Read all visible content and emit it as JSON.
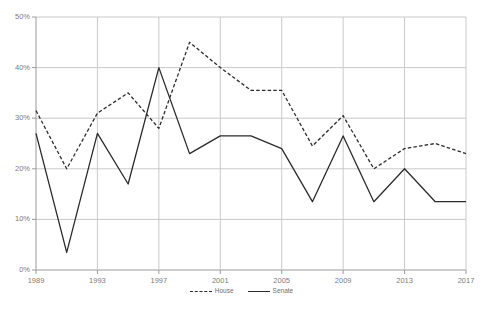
{
  "chart_data": {
    "type": "line",
    "title": "",
    "subtitle": "",
    "xlabel": "",
    "ylabel": "",
    "xlim": [
      1989,
      2017
    ],
    "ylim": [
      0,
      50
    ],
    "grid": true,
    "grid_axis": "both",
    "legend_position": "bottom-center",
    "x": [
      1989,
      1991,
      1993,
      1995,
      1997,
      1999,
      2001,
      2003,
      2005,
      2007,
      2009,
      2011,
      2013,
      2015,
      2017
    ],
    "categories": [
      "1989",
      "1991",
      "1993",
      "1995",
      "1997",
      "1999",
      "2001",
      "2003",
      "2005",
      "2007",
      "2009",
      "2011",
      "2013",
      "2015",
      "2017"
    ],
    "series": [
      {
        "name": "House",
        "style": "dashed",
        "color": "#2b2b2b",
        "values": [
          31.5,
          20.0,
          31.0,
          35.0,
          28.0,
          45.0,
          40.0,
          35.5,
          35.5,
          24.5,
          30.5,
          20.0,
          24.0,
          25.0,
          23.0
        ]
      },
      {
        "name": "Senate",
        "style": "solid",
        "color": "#2b2b2b",
        "values": [
          27.0,
          3.5,
          27.0,
          17.0,
          40.0,
          23.0,
          26.5,
          26.5,
          24.0,
          13.5,
          26.5,
          13.5,
          20.0,
          13.5,
          13.5
        ]
      }
    ],
    "yticks": [
      0,
      10,
      20,
      30,
      40,
      50
    ],
    "ytick_labels": [
      "0%",
      "10%",
      "20%",
      "30%",
      "40%",
      "50%"
    ],
    "xticks": [
      1989,
      1993,
      1997,
      2001,
      2005,
      2009,
      2013,
      2017
    ],
    "xtick_labels": [
      "1989",
      "1993",
      "1997",
      "2001",
      "2005",
      "2009",
      "2013",
      "2017"
    ]
  },
  "legend": {
    "items": [
      {
        "label": "House",
        "style": "dashed"
      },
      {
        "label": "Senate",
        "style": "solid"
      }
    ]
  },
  "colors": {
    "gridline": "#c9c9c9",
    "axis": "#9a9a9a",
    "series_line": "#2b2b2b",
    "tick_text": "#7b7b7b",
    "background": "#ffffff"
  }
}
